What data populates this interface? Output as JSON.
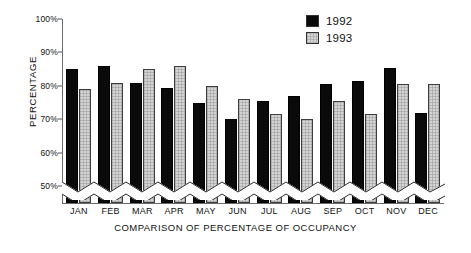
{
  "chart_data": {
    "type": "bar",
    "title": "",
    "xlabel": "COMPARISON OF PERCENTAGE OF OCCUPANCY",
    "ylabel": "PERCENTAGE",
    "categories": [
      "JAN",
      "FEB",
      "MAR",
      "APR",
      "MAY",
      "JUN",
      "JUL",
      "AUG",
      "SEP",
      "OCT",
      "NOV",
      "DEC"
    ],
    "series": [
      {
        "name": "1992",
        "color": "#0a0a0a",
        "values": [
          85,
          86,
          81,
          79.5,
          75,
          70,
          75.5,
          77,
          80.5,
          81.5,
          85.5,
          72
        ]
      },
      {
        "name": "1993",
        "color": "#d4d4d4",
        "values": [
          79,
          81,
          85,
          86,
          80,
          76,
          71.5,
          70,
          75.5,
          71.5,
          80.5,
          80.5
        ]
      }
    ],
    "ylim": [
      45,
      100
    ],
    "yticks": [
      50,
      60,
      70,
      80,
      90,
      100
    ],
    "ytick_labels": [
      "50%",
      "60%",
      "70%",
      "80%",
      "90%",
      "100%"
    ],
    "grid": false,
    "axis_broken": true,
    "legend_position": "top-right"
  },
  "legend": {
    "entries": [
      {
        "label": "1992"
      },
      {
        "label": "1993"
      }
    ]
  }
}
